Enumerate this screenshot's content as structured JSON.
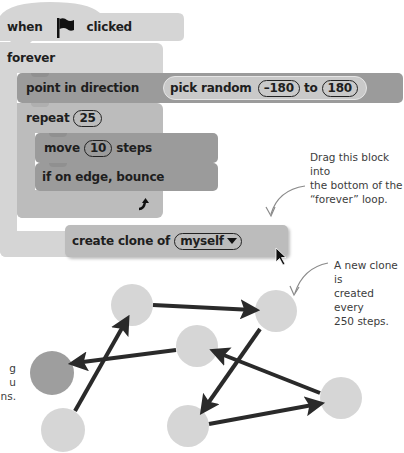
{
  "script": {
    "hat": {
      "prefix": "when",
      "icon": "green-flag-icon",
      "suffix": "clicked"
    },
    "forever": {
      "label": "forever"
    },
    "point_in_direction": {
      "label": "point in direction",
      "reporter": {
        "label": "pick random",
        "from": "–180",
        "to_label": "to",
        "to": "180"
      }
    },
    "repeat": {
      "label": "repeat",
      "count": "25"
    },
    "move": {
      "label": "move",
      "steps": "10",
      "suffix": "steps"
    },
    "bounce": {
      "label": "if on edge, bounce"
    },
    "loop_arrow_icon": "loop-arrow-icon",
    "create_clone": {
      "label": "create clone of",
      "target": "myself",
      "dropdown_icon": "triangle-down-icon"
    }
  },
  "annotations": {
    "drag_note": "Drag this block into the bottom of the “forever” loop.",
    "drag_note_lines": [
      "Drag this block into",
      "the bottom of the",
      "“forever” loop."
    ],
    "clone_note_lines": [
      "A new clone is",
      "created every",
      "250 steps."
    ],
    "clipped_note_lines": [
      "g",
      "u",
      "ns."
    ]
  },
  "diagram": {
    "circles": [
      {
        "id": "A",
        "cx": 132,
        "cy": 305,
        "r": 21,
        "color": "#d6d6d6"
      },
      {
        "id": "B",
        "cx": 276,
        "cy": 311,
        "r": 21,
        "color": "#d6d6d6"
      },
      {
        "id": "C",
        "cx": 197,
        "cy": 346,
        "r": 21,
        "color": "#d6d6d6"
      },
      {
        "id": "D",
        "cx": 52,
        "cy": 373,
        "r": 22,
        "color": "#9e9e9e"
      },
      {
        "id": "E",
        "cx": 63,
        "cy": 430,
        "r": 22,
        "color": "#d6d6d6"
      },
      {
        "id": "F",
        "cx": 188,
        "cy": 426,
        "r": 21,
        "color": "#d6d6d6"
      },
      {
        "id": "G",
        "cx": 341,
        "cy": 398,
        "r": 21,
        "color": "#d6d6d6"
      }
    ],
    "arrows": [
      {
        "from": "E",
        "to": "A",
        "x1": 75,
        "y1": 411,
        "x2": 126,
        "y2": 321
      },
      {
        "from": "A",
        "to": "B",
        "x1": 153,
        "y1": 305,
        "x2": 253,
        "y2": 310
      },
      {
        "from": "B",
        "to": "F",
        "x1": 260,
        "y1": 329,
        "x2": 204,
        "y2": 409
      },
      {
        "from": "F",
        "to": "G",
        "x1": 209,
        "y1": 424,
        "x2": 318,
        "y2": 404
      },
      {
        "from": "G",
        "to": "C",
        "x1": 320,
        "y1": 393,
        "x2": 216,
        "y2": 352
      },
      {
        "from": "C",
        "to": "D",
        "x1": 176,
        "y1": 350,
        "x2": 75,
        "y2": 363
      }
    ],
    "arrow_color": "#2a2a2a"
  }
}
